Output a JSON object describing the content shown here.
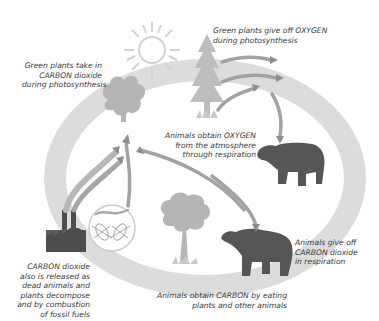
{
  "diagram": {
    "colors": {
      "cycle_ring": "#dcdcdc",
      "plant": "#b9b9b9",
      "animal": "#555555",
      "arrow": "#9a9a9a",
      "sun": "#cfcfcf",
      "text": "#3a3a3a"
    },
    "labels": {
      "plants_take_carbon": [
        "Green plants take in",
        "CARBON dioxide",
        "during photosynthesis"
      ],
      "plants_give_oxygen": [
        "Green plants give off OXYGEN",
        "during photosynthesis"
      ],
      "animals_obtain_oxygen": [
        "Animals obtain OXYGEN",
        "from the atmosphere",
        "through respiration"
      ],
      "animals_give_carbon": [
        "Animals give off",
        "CARBON dioxide",
        "in respiration"
      ],
      "animals_obtain_carbon": [
        "Animals obtain CARBON by eating",
        "plants and other animals"
      ],
      "carbon_released": [
        "CARBON dioxide",
        "also is released as",
        "dead animals and",
        "plants decompose",
        "and by combustion",
        "of fossil fuels"
      ]
    },
    "elements": [
      "sun",
      "deciduous-tree",
      "pine-tree",
      "bear-top",
      "bear-bottom",
      "tree-bottom",
      "factory",
      "microorganisms-circle",
      "cycle-ring",
      "flow-arrows"
    ]
  }
}
